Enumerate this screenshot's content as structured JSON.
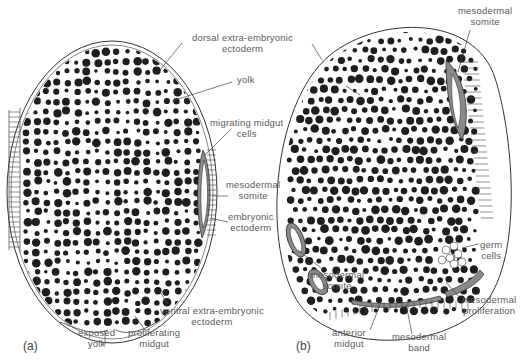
{
  "figure": {
    "panels": [
      {
        "id": "a",
        "label": "(a)",
        "annotations": {
          "dorsal": [
            "dorsal  extra-embryonic",
            "ectoderm"
          ],
          "yolk": "yolk",
          "migrating": [
            "migrating  midgut",
            "cells"
          ],
          "somite": [
            "mesodermal",
            "somite"
          ],
          "embryonic": [
            "embryonic",
            "ectoderm"
          ],
          "ventral": [
            "ventral  extra-embryonic",
            "ectoderm"
          ],
          "exposed": [
            "exposed",
            "yolk"
          ],
          "proliferating": [
            "proliferating",
            "midgut"
          ]
        }
      },
      {
        "id": "b",
        "label": "(b)",
        "annotations": {
          "somite_top": [
            "mesodermal",
            "somite"
          ],
          "germ": [
            "germ",
            "cells"
          ],
          "somite_left": [
            "mesodermal",
            "somite"
          ],
          "proliferation": [
            "mesodermal",
            "proliferation"
          ],
          "anterior": [
            "anterior",
            "midgut"
          ],
          "band": [
            "mesodermal",
            "band"
          ]
        }
      }
    ],
    "colors": {
      "ink": "#2a2a2a",
      "yolk": "#1e1e1e",
      "somite_fill": "#8a8a8a",
      "label": "#5a5a5a"
    }
  }
}
